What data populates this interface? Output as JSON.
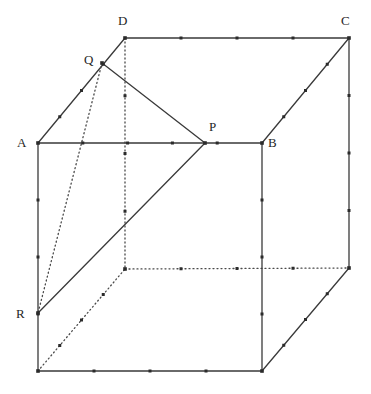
{
  "figure": {
    "type": "geometry-diagram",
    "width": 371,
    "height": 394,
    "background_color": "#ffffff",
    "line_color": "#3a3a3a",
    "hidden_line_color": "#4a4a4a",
    "tick_color": "#2b2b2b",
    "label_color": "#262626",
    "stroke_width": 1.3,
    "hidden_stroke_width": 1.3,
    "hidden_dash": "1,3"
  },
  "vertices": {
    "A": {
      "label": "A",
      "x": 38,
      "y": 143,
      "label_x": 17,
      "label_y": 136,
      "visible": true
    },
    "B": {
      "label": "B",
      "x": 262,
      "y": 143,
      "label_x": 268,
      "label_y": 136,
      "visible": true
    },
    "C": {
      "label": "C",
      "x": 349,
      "y": 38,
      "label_x": 341,
      "label_y": 14,
      "visible": true
    },
    "D": {
      "label": "D",
      "x": 125,
      "y": 38,
      "label_x": 118,
      "label_y": 14,
      "visible": true
    },
    "E": {
      "label": "",
      "x": 38,
      "y": 371,
      "label_x": 0,
      "label_y": 0,
      "visible": true
    },
    "F": {
      "label": "",
      "x": 262,
      "y": 371,
      "label_x": 0,
      "label_y": 0,
      "visible": true
    },
    "G": {
      "label": "",
      "x": 349,
      "y": 268,
      "label_x": 0,
      "label_y": 0,
      "visible": true
    },
    "H": {
      "label": "",
      "x": 125,
      "y": 269,
      "label_x": 0,
      "label_y": 0,
      "visible": false
    },
    "P": {
      "label": "P",
      "x": 205,
      "y": 143,
      "label_x": 209,
      "label_y": 120,
      "visible": true
    },
    "Q": {
      "label": "Q",
      "x": 102,
      "y": 63,
      "label_x": 84,
      "label_y": 53,
      "visible": true
    },
    "R": {
      "label": "R",
      "x": 38,
      "y": 313,
      "label_x": 16,
      "label_y": 307,
      "visible": true
    }
  },
  "edges_solid": [
    {
      "name": "edge-AB",
      "x1": 38,
      "y1": 143,
      "x2": 262,
      "y2": 143,
      "ticks": 4
    },
    {
      "name": "edge-DC",
      "x1": 125,
      "y1": 38,
      "x2": 349,
      "y2": 38,
      "ticks": 3
    },
    {
      "name": "edge-AD",
      "x1": 38,
      "y1": 143,
      "x2": 125,
      "y2": 38,
      "ticks": 3
    },
    {
      "name": "edge-BC",
      "x1": 262,
      "y1": 143,
      "x2": 349,
      "y2": 38,
      "ticks": 3
    },
    {
      "name": "edge-AE",
      "x1": 38,
      "y1": 143,
      "x2": 38,
      "y2": 371,
      "ticks": 3
    },
    {
      "name": "edge-BF",
      "x1": 262,
      "y1": 143,
      "x2": 262,
      "y2": 371,
      "ticks": 3
    },
    {
      "name": "edge-CG",
      "x1": 349,
      "y1": 38,
      "x2": 349,
      "y2": 268,
      "ticks": 3
    },
    {
      "name": "edge-EF",
      "x1": 38,
      "y1": 371,
      "x2": 262,
      "y2": 371,
      "ticks": 3
    },
    {
      "name": "edge-FG",
      "x1": 262,
      "y1": 371,
      "x2": 349,
      "y2": 268,
      "ticks": 3
    }
  ],
  "edges_hidden": [
    {
      "name": "edge-DH",
      "x1": 125,
      "y1": 38,
      "x2": 125,
      "y2": 269,
      "ticks": 3
    },
    {
      "name": "edge-HG",
      "x1": 125,
      "y1": 269,
      "x2": 349,
      "y2": 268,
      "ticks": 3
    },
    {
      "name": "edge-EH",
      "x1": 38,
      "y1": 371,
      "x2": 125,
      "y2": 269,
      "ticks": 3
    }
  ],
  "construction_solid": [
    {
      "name": "segment-QP",
      "x1": 102,
      "y1": 63,
      "x2": 205,
      "y2": 143,
      "ticks": 0
    },
    {
      "name": "segment-PR",
      "x1": 205,
      "y1": 143,
      "x2": 38,
      "y2": 313,
      "ticks": 0
    }
  ],
  "construction_hidden": [
    {
      "name": "segment-QR",
      "x1": 102,
      "y1": 63,
      "x2": 38,
      "y2": 313,
      "ticks": 0
    }
  ],
  "labels": {
    "A": "A",
    "B": "B",
    "C": "C",
    "D": "D",
    "P": "P",
    "Q": "Q",
    "R": "R"
  }
}
